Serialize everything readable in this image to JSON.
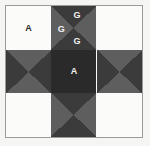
{
  "figure": {
    "border_color": "#9b9b9b",
    "page_background": "#f5f5f3"
  },
  "palette": {
    "light": "#fbfbfa",
    "mid_gray": "#5e5e5e",
    "dark_gray": "#3b3b3b",
    "very_dark": "#2a2a2a"
  },
  "grid": {
    "rows": 3,
    "columns": 3,
    "cells": [
      {
        "position": "top-left",
        "pattern": "solid",
        "fill": "#fbfbfa",
        "labels": [
          {
            "text": "A",
            "x": 50,
            "y": 50,
            "style": "dark-on-light"
          }
        ]
      },
      {
        "position": "top-center",
        "pattern": "hourglass-vertical",
        "fill_top": "#3b3b3b",
        "fill_bottom": "#3b3b3b",
        "fill_left": "#5e5e5e",
        "fill_right": "#5e5e5e",
        "labels": [
          {
            "text": "G",
            "x": 57,
            "y": 20,
            "style": "light-on-dark"
          },
          {
            "text": "G",
            "x": 22,
            "y": 52,
            "style": "light-on-dark"
          },
          {
            "text": "G",
            "x": 57,
            "y": 81,
            "style": "light-on-dark"
          }
        ]
      },
      {
        "position": "top-right",
        "pattern": "solid",
        "fill": "#fbfbfa",
        "labels": []
      },
      {
        "position": "middle-left",
        "pattern": "hourglass-horizontal",
        "fill_top": "#5e5e5e",
        "fill_bottom": "#5e5e5e",
        "fill_left": "#3b3b3b",
        "fill_right": "#3b3b3b",
        "labels": []
      },
      {
        "position": "center",
        "pattern": "solid",
        "fill": "#2a2a2a",
        "labels": [
          {
            "text": "A",
            "x": 50,
            "y": 50,
            "style": "light-on-dark"
          }
        ]
      },
      {
        "position": "middle-right",
        "pattern": "hourglass-horizontal",
        "fill_top": "#5e5e5e",
        "fill_bottom": "#5e5e5e",
        "fill_left": "#3b3b3b",
        "fill_right": "#3b3b3b",
        "labels": []
      },
      {
        "position": "bottom-left",
        "pattern": "solid",
        "fill": "#fbfbfa",
        "labels": []
      },
      {
        "position": "bottom-center",
        "pattern": "hourglass-vertical",
        "fill_top": "#3b3b3b",
        "fill_bottom": "#3b3b3b",
        "fill_left": "#5e5e5e",
        "fill_right": "#5e5e5e",
        "labels": []
      },
      {
        "position": "bottom-right",
        "pattern": "solid",
        "fill": "#fbfbfa",
        "labels": []
      }
    ]
  }
}
